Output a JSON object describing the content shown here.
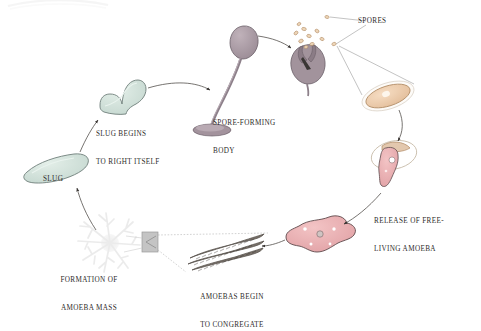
{
  "figure": {
    "background_color": "#ffffff",
    "ink_color": "#2e2b2a",
    "paper_tint": "#fbfaf8"
  },
  "labels": {
    "spores": "SPORES",
    "spore_forming_body": [
      "SPORE-FORMING",
      "BODY"
    ],
    "slug_begins": [
      "SLUG BEGINS",
      "TO RIGHT ITSELF"
    ],
    "slug": "SLUG",
    "formation_of_amoeba_mass": [
      "FORMATION OF",
      "AMOEBA MASS"
    ],
    "amoebas_congregate": [
      "AMOEBAS BEGIN",
      "TO CONGREGATE"
    ],
    "release_of_amoeba": [
      "RELEASE OF FREE-",
      "LIVING AMOEBA"
    ]
  },
  "colors": {
    "slug_fill": "#cfdfd8",
    "slug_stroke": "#6f7f7a",
    "stalk_fill": "#a99aa3",
    "stalk_stroke": "#6b5f68",
    "capsule_fill": "#a2939c",
    "spore_fill": "#e8c9a8",
    "spore_stroke": "#b08a64",
    "amoeba_fill": "#e9adb0",
    "amoeba_stroke": "#5d4a4c",
    "coat_fill": "#e3c8ae",
    "mass_fill": "#e7e7e7",
    "congregate_fill": "#5c5650",
    "callout_box": "#b9b9b9",
    "leader_line": "#9a9a9a"
  },
  "stages": [
    {
      "id": "spore-forming-body",
      "order": 1,
      "label": "SPORE-FORMING BODY"
    },
    {
      "id": "spore-capsule",
      "order": 2,
      "label": "SPORES"
    },
    {
      "id": "magnified-spore",
      "order": 3,
      "label": "SPORES"
    },
    {
      "id": "emerging-amoeba",
      "order": 4,
      "label": "RELEASE OF FREE-LIVING AMOEBA"
    },
    {
      "id": "free-living-amoeba",
      "order": 5,
      "label": "RELEASE OF FREE-LIVING AMOEBA"
    },
    {
      "id": "congregating-amoebas",
      "order": 6,
      "label": "AMOEBAS BEGIN TO CONGREGATE"
    },
    {
      "id": "amoeba-mass",
      "order": 7,
      "label": "FORMATION OF AMOEBA MASS"
    },
    {
      "id": "slug",
      "order": 8,
      "label": "SLUG"
    },
    {
      "id": "slug-righting",
      "order": 9,
      "label": "SLUG BEGINS TO RIGHT ITSELF"
    }
  ]
}
